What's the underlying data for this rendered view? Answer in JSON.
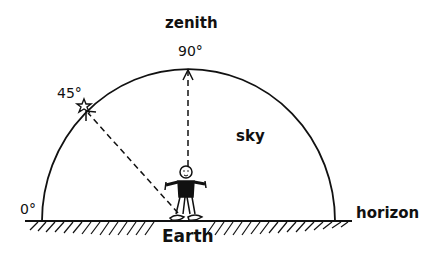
{
  "diagram": {
    "labels": {
      "zenith": "zenith",
      "angle_90": "90°",
      "angle_45": "45°",
      "angle_0": "0°",
      "sky": "sky",
      "horizon": "horizon",
      "earth": "Earth"
    },
    "elements": {
      "sky_dome": "semicircle",
      "observer": "stick-figure-person",
      "star": "star-icon",
      "zenith_arrow": "dashed arrow to 90°",
      "altitude_arrow": "dashed arrow to 45°",
      "ground": "hatched ground line"
    },
    "colors": {
      "ink": "#111111",
      "background": "#ffffff"
    }
  }
}
